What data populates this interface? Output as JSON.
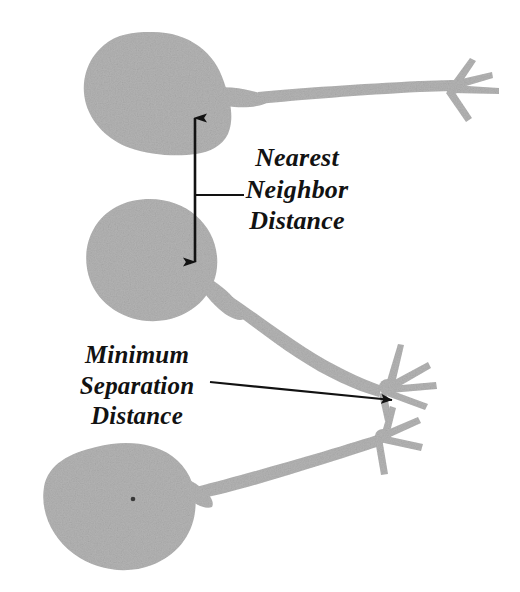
{
  "figure": {
    "background_color": "#ffffff",
    "cell_fill_color": "#b3b3b3",
    "annotation_color": "#121212",
    "canvas": {
      "width": 520,
      "height": 592
    }
  },
  "annotations": {
    "nearest_neighbor": {
      "name": "Nearest Neighbor Distance",
      "lines": [
        "Nearest",
        "Neighbor",
        "Distance"
      ],
      "line1": "Nearest",
      "line2": "Neighbor",
      "line3": "Distance",
      "arrow_type": "double-headed-vertical",
      "leader_line": true
    },
    "minimum_separation": {
      "name": "Minimum Separation Distance",
      "lines": [
        "Minimum",
        "Separation",
        "Distance"
      ],
      "line1": "Minimum",
      "line2": "Separation",
      "line3": "Distance",
      "arrow_type": "single-headed-pointer",
      "leader_line": true
    }
  },
  "cells": [
    {
      "id": "neuron-top",
      "label": "top neuron",
      "soma_shape": "teardrop",
      "axon_direction": "right",
      "terminal_branches": 4
    },
    {
      "id": "neuron-middle",
      "label": "middle neuron",
      "soma_shape": "round",
      "axon_direction": "down-right",
      "terminal_branches": 5
    },
    {
      "id": "neuron-bottom",
      "label": "bottom neuron",
      "soma_shape": "teardrop",
      "axon_direction": "up-right",
      "terminal_branches": 4,
      "has_nucleus_dot": true
    }
  ]
}
